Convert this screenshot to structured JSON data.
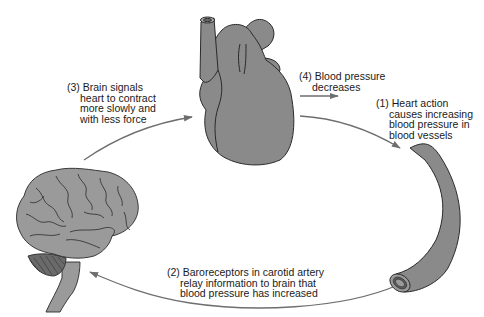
{
  "diagram": {
    "type": "cycle",
    "title": "",
    "colors": {
      "organ_fill": "#8a8a8a",
      "organ_outline": "#2a2a2a",
      "arrow": "#6e6e6e",
      "text": "#1a1a1a",
      "background": "#ffffff"
    },
    "nodes": [
      {
        "id": "heart",
        "name": "Heart",
        "icon": "heart-illustration"
      },
      {
        "id": "vessel",
        "name": "Blood vessel (carotid artery)",
        "icon": "artery-illustration"
      },
      {
        "id": "brain",
        "name": "Brain",
        "icon": "brain-illustration"
      }
    ],
    "steps": [
      {
        "number": "(1)",
        "lines": [
          "Heart action",
          "causes increasing",
          "blood pressure in",
          "blood vessels"
        ],
        "from": "heart",
        "to": "vessel"
      },
      {
        "number": "(2)",
        "lines": [
          "Baroreceptors in carotid artery",
          "relay information to brain that",
          "blood pressure has increased"
        ],
        "from": "vessel",
        "to": "brain"
      },
      {
        "number": "(3)",
        "lines": [
          "Brain signals",
          "heart to contract",
          "more slowly and",
          "with less force"
        ],
        "from": "brain",
        "to": "heart"
      },
      {
        "number": "(4)",
        "lines": [
          "Blood pressure",
          "decreases"
        ],
        "from": "heart",
        "to": "outcome"
      }
    ]
  }
}
